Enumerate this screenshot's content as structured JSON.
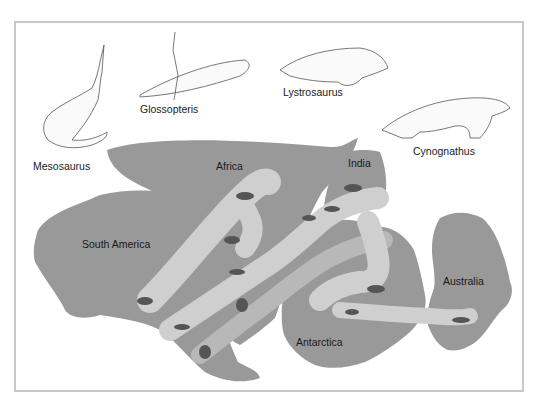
{
  "diagram": {
    "type": "fossil-distribution-map",
    "fossil_labels": [
      {
        "name": "Mesosaurus"
      },
      {
        "name": "Glossopteris"
      },
      {
        "name": "Lystrosaurus"
      },
      {
        "name": "Cynognathus"
      }
    ],
    "continent_labels": [
      {
        "name": "Africa"
      },
      {
        "name": "India"
      },
      {
        "name": "South America"
      },
      {
        "name": "Antarctica"
      },
      {
        "name": "Australia"
      }
    ],
    "colors": {
      "land": "#999999",
      "fossil_band": "#cfcfcf",
      "band_mid": "#b5b5b5",
      "silhouette": "#555555",
      "frame": "#c8c8c8",
      "sea": "#ffffff"
    }
  }
}
